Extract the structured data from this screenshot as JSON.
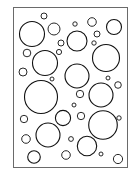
{
  "figure": {
    "frame": {
      "x": 13,
      "y": 7,
      "width": 114,
      "height": 160,
      "stroke": "#6a6a6a"
    },
    "stroke_color": "#111111",
    "fill_color": "#ffffff",
    "circles": [
      {
        "cx": 44,
        "cy": 16,
        "r": 3
      },
      {
        "cx": 32,
        "cy": 34,
        "r": 12.5
      },
      {
        "cx": 54,
        "cy": 29,
        "r": 6
      },
      {
        "cx": 75,
        "cy": 24,
        "r": 2.2
      },
      {
        "cx": 92,
        "cy": 22,
        "r": 4.3
      },
      {
        "cx": 114,
        "cy": 27,
        "r": 7.5
      },
      {
        "cx": 77,
        "cy": 41,
        "r": 10
      },
      {
        "cx": 97,
        "cy": 34,
        "r": 3
      },
      {
        "cx": 61,
        "cy": 43,
        "r": 3
      },
      {
        "cx": 94,
        "cy": 43,
        "r": 2.2
      },
      {
        "cx": 106,
        "cy": 58,
        "r": 13.5
      },
      {
        "cx": 27,
        "cy": 53,
        "r": 3.8
      },
      {
        "cx": 59,
        "cy": 52,
        "r": 2.6
      },
      {
        "cx": 45,
        "cy": 63,
        "r": 12.5
      },
      {
        "cx": 23,
        "cy": 72,
        "r": 4
      },
      {
        "cx": 77,
        "cy": 76,
        "r": 12
      },
      {
        "cx": 52,
        "cy": 79,
        "r": 2
      },
      {
        "cx": 108,
        "cy": 78,
        "r": 2
      },
      {
        "cx": 118,
        "cy": 85,
        "r": 3.3
      },
      {
        "cx": 41,
        "cy": 97,
        "r": 16.5
      },
      {
        "cx": 80,
        "cy": 94,
        "r": 3.7
      },
      {
        "cx": 101,
        "cy": 95,
        "r": 12
      },
      {
        "cx": 74,
        "cy": 105,
        "r": 2
      },
      {
        "cx": 63,
        "cy": 118,
        "r": 7.6
      },
      {
        "cx": 81,
        "cy": 116,
        "r": 3.7
      },
      {
        "cx": 24,
        "cy": 119,
        "r": 3.7
      },
      {
        "cx": 103,
        "cy": 125,
        "r": 14.3
      },
      {
        "cx": 119,
        "cy": 118,
        "r": 2.2
      },
      {
        "cx": 48,
        "cy": 135,
        "r": 12
      },
      {
        "cx": 26,
        "cy": 139,
        "r": 4.3
      },
      {
        "cx": 71,
        "cy": 139,
        "r": 2.4
      },
      {
        "cx": 87,
        "cy": 146,
        "r": 9.7
      },
      {
        "cx": 34,
        "cy": 157,
        "r": 6.3
      },
      {
        "cx": 66,
        "cy": 155,
        "r": 4.3
      },
      {
        "cx": 101,
        "cy": 154,
        "r": 2
      },
      {
        "cx": 118,
        "cy": 159,
        "r": 4.6
      }
    ]
  }
}
